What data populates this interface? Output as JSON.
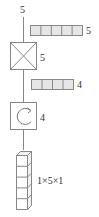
{
  "diagram": {
    "input_label": "5",
    "vector_top": {
      "cells": 5,
      "label": "5"
    },
    "dense_block": {
      "icon": "cross-box-icon",
      "label": "5"
    },
    "vector_mid": {
      "cells": 4,
      "label": "4"
    },
    "recurrent_block": {
      "icon": "rotate-cw-icon",
      "label": "4"
    },
    "output_tensor": {
      "cubes": 5,
      "label": "1×5×1"
    }
  },
  "colors": {
    "stroke": "#888888",
    "cell_fill": "#e6e6e6",
    "text": "#333333"
  }
}
